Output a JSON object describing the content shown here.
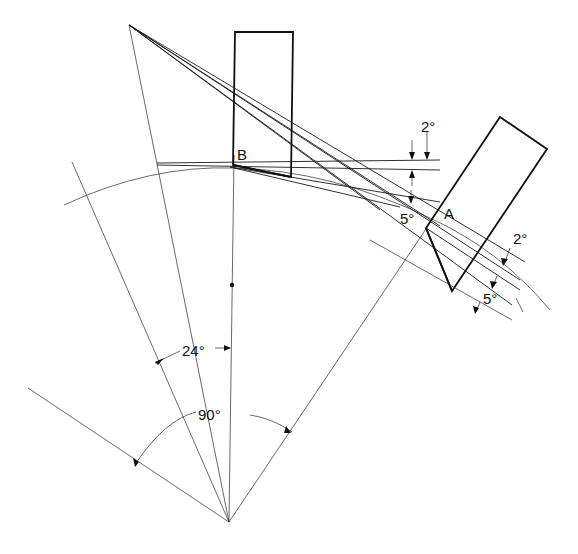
{
  "diagram": {
    "type": "technical-geometry",
    "labels": {
      "point_b": "B",
      "point_a": "A",
      "angle_top_2": "2°",
      "angle_mid_5": "5°",
      "angle_right_2": "2°",
      "angle_right_5": "5°",
      "angle_24": "24°",
      "angle_90": "90°"
    },
    "colors": {
      "ink": "#111111",
      "background": "#ffffff"
    }
  }
}
